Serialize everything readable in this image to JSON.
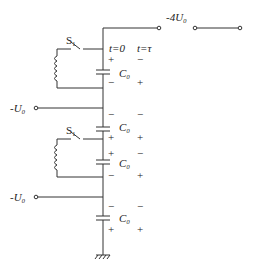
{
  "diagram": {
    "type": "circuit",
    "output_label": "-4U₀",
    "input_labels": [
      "-U₀",
      "-U₀"
    ],
    "switch_labels": [
      "S₁",
      "S₁"
    ],
    "time_labels": [
      "t=0",
      "t=τ"
    ],
    "capacitor_labels": [
      "C₀",
      "C₀",
      "C₀",
      "C₀"
    ],
    "capacitors": [
      {
        "label": "C₀",
        "t0_top": "+",
        "t0_bottom": "−",
        "ttau_top": "−",
        "ttau_bottom": "+"
      },
      {
        "label": "C₀",
        "t0_top": "−",
        "t0_bottom": "+",
        "ttau_top": "−",
        "ttau_bottom": "+"
      },
      {
        "label": "C₀",
        "t0_top": "+",
        "t0_bottom": "−",
        "ttau_top": "−",
        "ttau_bottom": "+"
      },
      {
        "label": "C₀",
        "t0_top": "−",
        "t0_bottom": "+",
        "ttau_top": "−",
        "ttau_bottom": "+"
      }
    ],
    "colors": {
      "line": "#333333",
      "background": "#ffffff"
    }
  }
}
